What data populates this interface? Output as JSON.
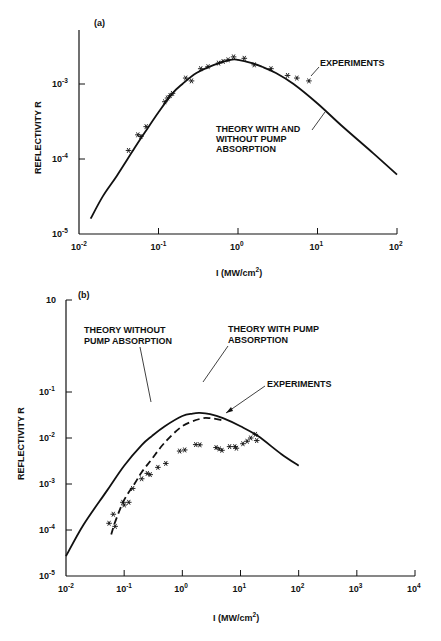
{
  "chart_data": [
    {
      "panel": "(a)",
      "type": "line",
      "xscale": "log",
      "yscale": "log",
      "xlabel": "I (MW/cm²)",
      "ylabel": "REFLECTIVITY R",
      "xlim": [
        0.01,
        100
      ],
      "ylim": [
        1e-05,
        0.005
      ],
      "x_ticks": [
        "10-2",
        "10-1",
        "100",
        "101",
        "102"
      ],
      "y_ticks": [
        "10-5",
        "10-4",
        "10-3"
      ],
      "grid": false,
      "series": [
        {
          "name": "THEORY WITH AND WITHOUT PUMP ABSORPTION",
          "style": "solid",
          "x": [
            0.014,
            0.02,
            0.03,
            0.05,
            0.07,
            0.1,
            0.15,
            0.2,
            0.3,
            0.5,
            0.8,
            1.0,
            1.5,
            2.0,
            3.0,
            5.0,
            10,
            20,
            50,
            100
          ],
          "y": [
            1.6e-05,
            3.2e-05,
            6e-05,
            0.00014,
            0.00024,
            0.00042,
            0.00075,
            0.001,
            0.0014,
            0.0018,
            0.0021,
            0.0021,
            0.0019,
            0.0017,
            0.0014,
            0.001,
            0.00055,
            0.00028,
            0.00012,
            6.2e-05
          ]
        },
        {
          "name": "EXPERIMENTS",
          "style": "markers",
          "marker": "asterisk",
          "x": [
            0.042,
            0.055,
            0.06,
            0.07,
            0.12,
            0.13,
            0.14,
            0.15,
            0.22,
            0.26,
            0.34,
            0.42,
            0.57,
            0.65,
            0.75,
            0.88,
            1.2,
            1.6,
            2.6,
            4.2,
            5.5,
            7.8
          ],
          "y": [
            0.00013,
            0.00021,
            0.0002,
            0.00027,
            0.00058,
            0.00065,
            0.0007,
            0.00075,
            0.0012,
            0.0011,
            0.0016,
            0.0017,
            0.0019,
            0.002,
            0.0021,
            0.0023,
            0.0022,
            0.0018,
            0.0016,
            0.0013,
            0.0012,
            0.0011
          ]
        }
      ],
      "annotations": [
        "(a)",
        "EXPERIMENTS",
        "THEORY WITH AND",
        "WITHOUT PUMP",
        "ABSORPTION"
      ]
    },
    {
      "panel": "(b)",
      "type": "line",
      "xscale": "log",
      "yscale": "log",
      "xlabel": "I (MW/cm²)",
      "ylabel": "REFLECTIVITY R",
      "xlim": [
        0.01,
        10000
      ],
      "ylim": [
        1e-05,
        10
      ],
      "x_ticks": [
        "10-2",
        "10-1",
        "100",
        "101",
        "102",
        "103",
        "104"
      ],
      "y_ticks": [
        "10-5",
        "10-4",
        "10-3",
        "10-2",
        "10-1",
        "10"
      ],
      "grid": false,
      "series": [
        {
          "name": "THEORY WITHOUT PUMP ABSORPTION",
          "style": "solid",
          "x": [
            0.01,
            0.02,
            0.05,
            0.1,
            0.2,
            0.3,
            0.5,
            1.0,
            1.5,
            2.0,
            3.0,
            5.0,
            10,
            20,
            50,
            100
          ],
          "y": [
            2.7e-05,
            0.00013,
            0.0007,
            0.0025,
            0.007,
            0.011,
            0.018,
            0.03,
            0.034,
            0.035,
            0.033,
            0.027,
            0.018,
            0.011,
            0.0045,
            0.0025
          ]
        },
        {
          "name": "THEORY WITH PUMP ABSORPTION",
          "style": "dashed",
          "x": [
            0.06,
            0.07,
            0.1,
            0.15,
            0.2,
            0.3,
            0.5,
            1.0,
            2.0,
            3.0,
            5.0
          ],
          "y": [
            8e-05,
            0.00015,
            0.00045,
            0.001,
            0.0018,
            0.0035,
            0.008,
            0.018,
            0.026,
            0.027,
            0.024
          ]
        },
        {
          "name": "EXPERIMENTS",
          "style": "markers",
          "marker": "asterisk",
          "x": [
            0.055,
            0.065,
            0.07,
            0.095,
            0.1,
            0.12,
            0.14,
            0.2,
            0.25,
            0.28,
            0.38,
            0.52,
            0.9,
            1.1,
            1.7,
            2.0,
            3.8,
            4.3,
            4.8,
            6.5,
            8.0,
            8.5,
            11,
            13,
            15,
            18,
            19
          ],
          "y": [
            0.00014,
            0.00022,
            0.00012,
            0.0004,
            0.00035,
            0.0004,
            0.0008,
            0.0013,
            0.0017,
            0.0016,
            0.0023,
            0.0028,
            0.0052,
            0.0055,
            0.0072,
            0.0071,
            0.0062,
            0.0058,
            0.0054,
            0.0065,
            0.0065,
            0.006,
            0.0075,
            0.0085,
            0.01,
            0.012,
            0.0088
          ]
        }
      ],
      "annotations": [
        "(b)",
        "THEORY WITHOUT",
        "PUMP ABSORPTION",
        "THEORY WITH PUMP",
        "ABSORPTION",
        "EXPERIMENTS"
      ]
    }
  ],
  "panel_a": {
    "label": "(a)",
    "ylabel": "REFLECTIVITY  R",
    "xlabel_main": "I  (MW/cm",
    "xlabel_sup": "2",
    "xlabel_close": ")",
    "annotation_experiments": "EXPERIMENTS",
    "annotation_theory": [
      "THEORY WITH AND",
      "WITHOUT PUMP",
      "ABSORPTION"
    ],
    "xticks": [
      {
        "base": "10",
        "exp": "-2"
      },
      {
        "base": "10",
        "exp": "-1"
      },
      {
        "base": "10",
        "exp": "0"
      },
      {
        "base": "10",
        "exp": "1"
      },
      {
        "base": "10",
        "exp": "2"
      }
    ],
    "yticks": [
      {
        "base": "10",
        "exp": "-5"
      },
      {
        "base": "10",
        "exp": "-4"
      },
      {
        "base": "10",
        "exp": "-3"
      }
    ]
  },
  "panel_b": {
    "label": "(b)",
    "ylabel": "REFLECTIVITY  R",
    "xlabel_main": "I  (MW/cm",
    "xlabel_sup": "2",
    "xlabel_close": ")",
    "annotation_theory_without": [
      "THEORY WITHOUT",
      "PUMP ABSORPTION"
    ],
    "annotation_theory_with": [
      "THEORY WITH PUMP",
      "ABSORPTION"
    ],
    "annotation_experiments": "EXPERIMENTS",
    "xticks": [
      {
        "base": "10",
        "exp": "-2"
      },
      {
        "base": "10",
        "exp": "-1"
      },
      {
        "base": "10",
        "exp": "0"
      },
      {
        "base": "10",
        "exp": "1"
      },
      {
        "base": "10",
        "exp": "2"
      },
      {
        "base": "10",
        "exp": "3"
      },
      {
        "base": "10",
        "exp": "4"
      }
    ],
    "yticks": [
      {
        "base": "10",
        "exp": "-5"
      },
      {
        "base": "10",
        "exp": "-4"
      },
      {
        "base": "10",
        "exp": "-3"
      },
      {
        "base": "10",
        "exp": "-2"
      },
      {
        "base": "10",
        "exp": "-1"
      },
      {
        "base": "10",
        "exp": ""
      }
    ]
  }
}
